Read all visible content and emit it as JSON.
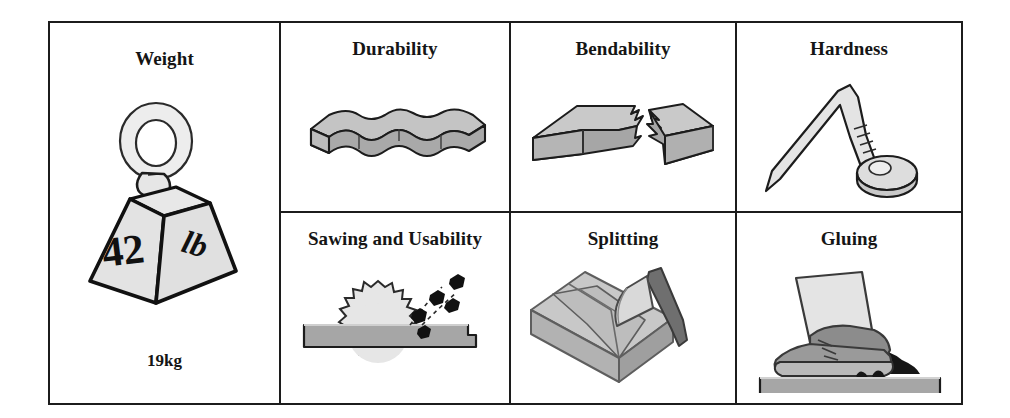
{
  "diagram": {
    "title_font_color": "#151515",
    "border_color": "#1c1c1c",
    "background": "#ffffff",
    "palette": {
      "light_gray": "#e3e3e3",
      "mid_gray": "#a9a9a9",
      "dark_gray": "#7c7c7c",
      "outline": "#1c1c1c",
      "black": "#111111"
    },
    "cells": [
      {
        "id": "weight",
        "title": "Weight",
        "icon": "hanging-weight-icon",
        "weight_lb": "42",
        "weight_lb_unit": "lb",
        "caption": "19kg"
      },
      {
        "id": "durability",
        "title": "Durability",
        "icon": "weathered-plank-icon"
      },
      {
        "id": "bendability",
        "title": "Bendability",
        "icon": "snapped-beam-icon"
      },
      {
        "id": "hardness",
        "title": "Hardness",
        "icon": "bent-nail-icon"
      },
      {
        "id": "sawing-and-usability",
        "title": "Sawing and Usability",
        "icon": "circular-saw-blade-icon"
      },
      {
        "id": "splitting",
        "title": "Splitting",
        "icon": "log-and-axe-icon"
      },
      {
        "id": "gluing",
        "title": "Gluing",
        "icon": "glued-boot-icon"
      }
    ]
  }
}
